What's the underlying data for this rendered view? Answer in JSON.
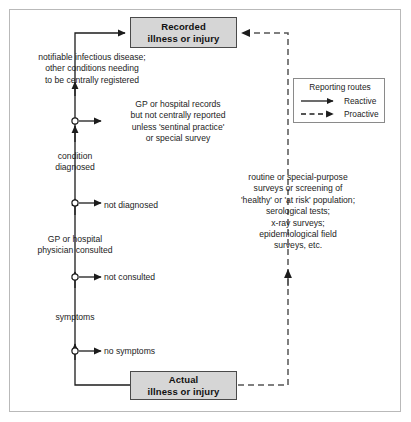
{
  "figure": {
    "background": "#ffffff",
    "frame_color": "#b9b9b9"
  },
  "nodes": {
    "recorded": {
      "line1": "Recorded",
      "line2": "illness or injury",
      "fill": "#d6d6d6",
      "border": "#4a4a4a"
    },
    "actual": {
      "line1": "Actual",
      "line2": "illness or injury",
      "fill": "#d6d6d6",
      "border": "#4a4a4a"
    }
  },
  "labels": {
    "notifiable": "notifiable infectious disease;\nother conditions needing\nto be centrally registered",
    "gp_records": "GP or hospital records\nbut not centrally reported\nunless 'sentinal practice'\nor special survey",
    "condition_diagnosed": "condition\ndiagnosed",
    "not_diagnosed": "not diagnosed",
    "gp_physician_consulted": "GP or hospital\nphysician consulted",
    "not_consulted": "not consulted",
    "symptoms": "symptoms",
    "no_symptoms": "no symptoms",
    "surveys": "routine or special-purpose\nsurveys or screening of\n'healthy' or 'at risk' population;\nserological tests;\nx-ray surveys;\nepidemiological field\nsurveys, etc."
  },
  "legend": {
    "title": "Reporting routes",
    "items": [
      {
        "label": "Reactive",
        "style": "solid",
        "icon": "solid-arrow-icon"
      },
      {
        "label": "Proactive",
        "style": "dashed",
        "icon": "dashed-arrow-icon"
      }
    ],
    "border": "#8a8a8a"
  },
  "edges": {
    "reactive_color": "#1c1c1c",
    "proactive_color": "#555555",
    "junction_marker": "open-circle"
  }
}
